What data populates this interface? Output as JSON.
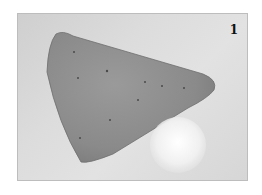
{
  "figure": {
    "step_number": "1",
    "colors": {
      "background": "#ffffff",
      "surface": "#d8d8d8",
      "felt": "#8e8e8e",
      "pompom": "#f4f4f4"
    }
  }
}
